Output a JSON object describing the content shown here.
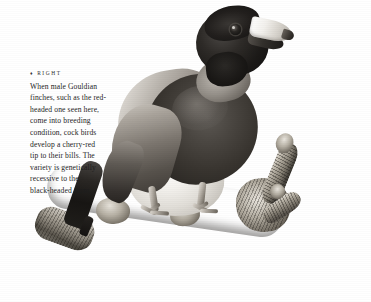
{
  "page": {
    "background_color": "#ffffff",
    "width": 371,
    "height": 302
  },
  "caption": {
    "marker": "♦",
    "header": "RIGHT",
    "lines": [
      "When male Gouldian",
      "finches, such as the red-",
      "headed one seen here,",
      "come into breeding",
      "condition, cock birds",
      "develop a cherry-red",
      "tip to their bills. The",
      "variety is genetically",
      "recessive to the",
      "black-headed form."
    ],
    "full_text": "When male Gouldian finches, such as the red-headed one seen here, come into breeding condition, cock birds develop a cherry-red tip to their bills. The variety is genetically recessive to the black-headed form.",
    "text_color": "#1d1d1d"
  },
  "photograph": {
    "subject": "gouldian-finch",
    "description": "Black and white photograph of a Gouldian finch perched on a forked tree branch",
    "orientation": "facing right",
    "parts": {
      "head": "black head",
      "beak": "pale conical bill with dark tip",
      "eye": "dark round eye",
      "breast": "dark breast band",
      "belly": "pale belly",
      "back": "mid-gray back and wing",
      "tail": "dark pointed tail angled down-left",
      "legs": "pale legs gripping branch",
      "perch": "textured branch forking into two twigs"
    },
    "tones": {
      "darkest": "#111010",
      "mid": "#8b8579",
      "lightest": "#ffffff"
    }
  }
}
